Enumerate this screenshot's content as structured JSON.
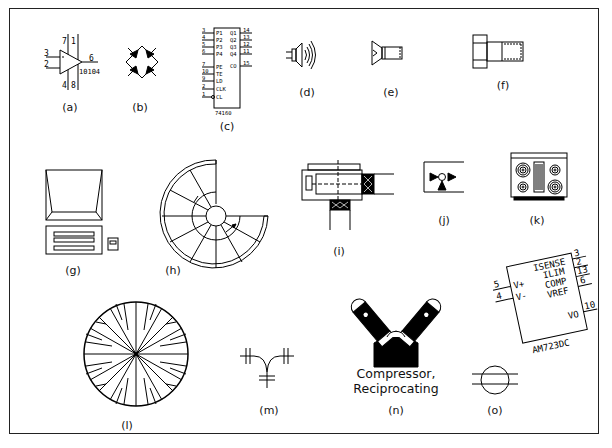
{
  "figure": {
    "title": "",
    "colors": {
      "stroke": "#000000",
      "background": "#ffffff",
      "frame": "#222222"
    },
    "items": [
      {
        "id": "a",
        "caption": "(a)",
        "icon": "op-amp-icon",
        "pins": [
          "7",
          "1",
          "3",
          "2",
          "6",
          "4",
          "8"
        ],
        "part": "10104"
      },
      {
        "id": "b",
        "caption": "(b)",
        "icon": "diode-bridge-icon"
      },
      {
        "id": "c",
        "caption": "(c)",
        "icon": "ic-chip-icon",
        "left_pins": [
          {
            "num": "3",
            "name": "P1"
          },
          {
            "num": "4",
            "name": "P2"
          },
          {
            "num": "5",
            "name": "P3"
          },
          {
            "num": "6",
            "name": "P4"
          },
          {
            "num": "7",
            "name": "PE"
          },
          {
            "num": "10",
            "name": "TE"
          },
          {
            "num": "9",
            "name": "LD"
          },
          {
            "num": "2",
            "name": "CLK"
          },
          {
            "num": "1",
            "name": "CL"
          }
        ],
        "right_pins": [
          {
            "num": "14",
            "name": "Q1"
          },
          {
            "num": "13",
            "name": "Q2"
          },
          {
            "num": "12",
            "name": "Q3"
          },
          {
            "num": "11",
            "name": "Q4"
          },
          {
            "num": "15",
            "name": "CO"
          }
        ],
        "part": "74160"
      },
      {
        "id": "d",
        "caption": "(d)",
        "icon": "speaker-icon"
      },
      {
        "id": "e",
        "caption": "(e)",
        "icon": "flat-head-screw-icon"
      },
      {
        "id": "f",
        "caption": "(f)",
        "icon": "hex-bolt-icon"
      },
      {
        "id": "g",
        "caption": "(g)",
        "icon": "computer-icon"
      },
      {
        "id": "h",
        "caption": "(h)",
        "icon": "spiral-staircase-icon"
      },
      {
        "id": "i",
        "caption": "(i)",
        "icon": "valve-actuator-icon"
      },
      {
        "id": "j",
        "caption": "(j)",
        "icon": "three-way-valve-icon"
      },
      {
        "id": "k",
        "caption": "(k)",
        "icon": "cooktop-range-icon"
      },
      {
        "id": "l",
        "caption": "(l)",
        "icon": "tree-plan-icon"
      },
      {
        "id": "m",
        "caption": "(m)",
        "icon": "pipe-tee-icon"
      },
      {
        "id": "n",
        "caption": "(n)",
        "icon": "reciprocating-compressor-icon",
        "label_line1": "Compressor,",
        "label_line2": "Reciprocating"
      },
      {
        "id": "o",
        "caption": "(o)",
        "icon": "circle-lines-icon"
      },
      {
        "id": "p",
        "caption": "",
        "icon": "ic-regulator-icon",
        "left_pins": [
          {
            "num": "5",
            "name": "V+"
          },
          {
            "num": "4",
            "name": "V-"
          }
        ],
        "right_pins": [
          {
            "num": "3",
            "name": "ISENSE"
          },
          {
            "num": "2",
            "name": "ILIM"
          },
          {
            "num": "13",
            "name": "COMP"
          },
          {
            "num": "6",
            "name": "VREF"
          },
          {
            "num": "10",
            "name": "VO"
          }
        ],
        "part": "AM723DC"
      }
    ]
  }
}
